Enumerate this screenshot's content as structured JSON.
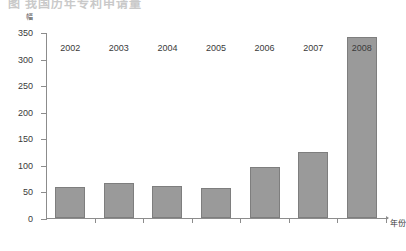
{
  "header": {
    "cropped_title": "图  我国历年专利申请量"
  },
  "chart_data": {
    "type": "bar",
    "title": "",
    "xlabel": "年份",
    "ylabel": "幅",
    "categories": [
      "2002",
      "2003",
      "2004",
      "2005",
      "2006",
      "2007",
      "2008"
    ],
    "values": [
      59,
      66,
      60,
      56,
      96,
      124,
      340
    ],
    "ylim": [
      0,
      350
    ],
    "yticks": [
      0,
      50,
      100,
      150,
      200,
      250,
      300,
      350
    ],
    "ytick_labels": [
      "0",
      "50",
      "100",
      "150",
      "200",
      "250",
      "300",
      "350"
    ],
    "grid": false,
    "legend": null,
    "bar_color": "#9a9a9a",
    "bar_edge_color": "#7e7e7e",
    "axis_color": "#8c8c8c"
  }
}
